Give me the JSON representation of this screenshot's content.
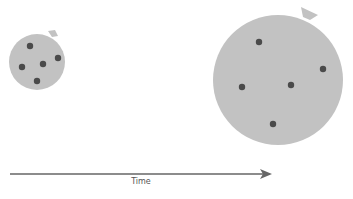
{
  "colors": {
    "cell_fill": "#c2c2c2",
    "dot_fill": "#4a4a4a",
    "arrow": "#666666",
    "label": "#555555"
  },
  "cells": [
    {
      "name": "small-cell",
      "cx": 37,
      "cy": 62,
      "r": 28,
      "tab": [
        [
          48,
          31
        ],
        [
          55,
          30
        ],
        [
          58,
          36
        ],
        [
          52,
          37
        ]
      ],
      "dots": [
        [
          30,
          46
        ],
        [
          58,
          58
        ],
        [
          22,
          67
        ],
        [
          43,
          64
        ],
        [
          37,
          81
        ]
      ]
    },
    {
      "name": "large-cell",
      "cx": 278,
      "cy": 80,
      "r": 65,
      "tab": [
        [
          301,
          7
        ],
        [
          318,
          15
        ],
        [
          310,
          20
        ],
        [
          303,
          17
        ]
      ],
      "dots": [
        [
          259,
          42
        ],
        [
          323,
          69
        ],
        [
          242,
          87
        ],
        [
          291,
          85
        ],
        [
          273,
          124
        ]
      ]
    }
  ],
  "axis": {
    "label": "Time",
    "x1": 10,
    "y": 174,
    "x2": 272
  }
}
